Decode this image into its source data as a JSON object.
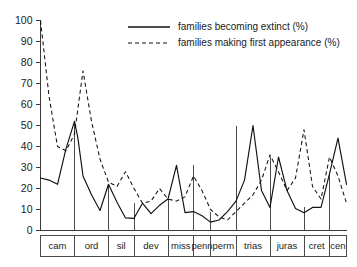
{
  "chart_data": {
    "type": "line",
    "title": "",
    "xlabel": "",
    "ylabel": "",
    "ylim": [
      0,
      100
    ],
    "yticks": [
      0,
      10,
      20,
      30,
      40,
      50,
      60,
      70,
      80,
      90,
      100
    ],
    "grid": false,
    "legend_position": "top-center",
    "categories": [
      "cam",
      "ord",
      "sil",
      "dev",
      "miss",
      "penn",
      "perm",
      "trias",
      "juras",
      "cret",
      "cen"
    ],
    "period_boundaries_x": [
      0,
      4,
      8,
      11,
      15,
      18,
      20,
      23,
      27,
      31,
      34,
      36
    ],
    "series": [
      {
        "name": "families becoming extinct (%)",
        "style": "solid",
        "x": [
          0,
          1,
          2,
          3,
          4,
          4.4,
          5,
          6,
          7,
          8,
          9,
          10,
          11,
          12,
          13,
          14,
          15,
          16,
          17,
          18,
          19,
          20,
          21,
          22,
          23,
          24,
          25,
          26,
          27,
          28,
          29,
          30,
          31,
          32,
          33,
          34,
          35,
          36
        ],
        "values": [
          25,
          24,
          22,
          39,
          52,
          44,
          26,
          17,
          9.5,
          22,
          13.5,
          6,
          5.8,
          13,
          8,
          12,
          15,
          31,
          8.5,
          9,
          7,
          4,
          5,
          9,
          14,
          24,
          50,
          19,
          11,
          35,
          19,
          10.5,
          8.5,
          11,
          11,
          27,
          44,
          22
        ]
      },
      {
        "name": "families making first appearance (%)",
        "style": "dashed",
        "x": [
          0,
          1,
          2,
          3,
          4,
          5,
          6,
          7,
          8,
          9,
          10,
          11,
          12,
          13,
          14,
          15,
          16,
          17,
          18,
          19,
          20,
          21,
          22,
          23,
          24,
          25,
          26,
          27,
          28,
          29,
          30,
          31,
          32,
          33,
          34,
          35,
          36
        ],
        "values": [
          100,
          64,
          40,
          38,
          46,
          76,
          52,
          34,
          23,
          21,
          28,
          20,
          13,
          14,
          20,
          15,
          14,
          16,
          26,
          19,
          10,
          6.5,
          5,
          9,
          13,
          17,
          24,
          36,
          28,
          19,
          25,
          48,
          21,
          15,
          35,
          26,
          13
        ]
      }
    ],
    "legend": [
      {
        "label": "families becoming extinct (%)",
        "style": "solid"
      },
      {
        "label": "families making first appearance (%)",
        "style": "dashed"
      }
    ]
  },
  "colors": {
    "ink": "#111111",
    "axis": "#3a3a3a",
    "background": "#ffffff"
  }
}
